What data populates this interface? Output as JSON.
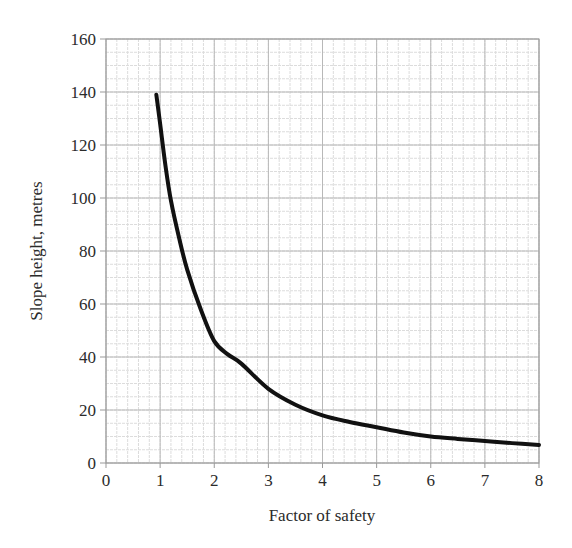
{
  "chart_data": {
    "type": "line",
    "title": "",
    "xlabel": "Factor of safety",
    "ylabel": "Slope height, metres",
    "xlim": [
      0,
      8
    ],
    "ylim": [
      0,
      160
    ],
    "x_ticks": [
      0,
      1,
      2,
      3,
      4,
      5,
      6,
      7,
      8
    ],
    "y_ticks": [
      0,
      20,
      40,
      60,
      80,
      100,
      120,
      140,
      160
    ],
    "x_minor_step": 0.2,
    "y_minor_step": 5,
    "grid": true,
    "legend": null,
    "series": [
      {
        "name": "Slope height vs factor of safety",
        "color": "#111111",
        "x": [
          0.93,
          1.0,
          1.1,
          1.2,
          1.35,
          1.5,
          1.75,
          2.0,
          2.25,
          2.5,
          3.0,
          3.5,
          4.0,
          4.5,
          5.0,
          5.5,
          6.0,
          6.5,
          7.0,
          7.5,
          8.0
        ],
        "y": [
          139,
          128,
          112,
          99,
          85,
          73,
          58,
          46,
          41,
          37.5,
          28,
          22,
          18,
          15.5,
          13.5,
          11.5,
          10,
          9.1,
          8.3,
          7.5,
          6.8
        ]
      }
    ]
  },
  "colors": {
    "grid_major": "#b8b8b8",
    "grid_minor": "#dcdcdc",
    "axis": "#999999",
    "curve": "#111111",
    "text": "#2b2b2b"
  }
}
